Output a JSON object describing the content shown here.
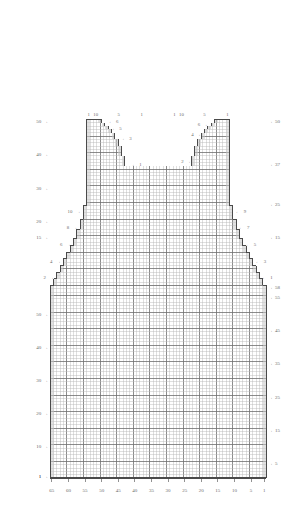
{
  "chart_data": {
    "type": "table",
    "title": "",
    "subtitle": "",
    "xlabel": "",
    "ylabel": "",
    "grid": true,
    "legend_position": "none",
    "cell_px": 3.32,
    "major_every": 5,
    "stitch_columns": 65,
    "bottom_rows": 58,
    "top_rows": 50,
    "x_axis": {
      "label": "",
      "ticks": [
        {
          "value": 65,
          "text": "65"
        },
        {
          "value": 60,
          "text": "60"
        },
        {
          "value": 55,
          "text": "55"
        },
        {
          "value": 50,
          "text": "50"
        },
        {
          "value": 45,
          "text": "45"
        },
        {
          "value": 40,
          "text": "40"
        },
        {
          "value": 35,
          "text": "35"
        },
        {
          "value": 30,
          "text": "30"
        },
        {
          "value": 25,
          "text": "25"
        },
        {
          "value": 20,
          "text": "20"
        },
        {
          "value": 15,
          "text": "15"
        },
        {
          "value": 10,
          "text": "10"
        },
        {
          "value": 5,
          "text": "5"
        },
        {
          "value": 1,
          "text": "1"
        }
      ]
    },
    "left_axis_upper": {
      "ticks": [
        {
          "value": 50,
          "text": "50"
        },
        {
          "value": 40,
          "text": "40"
        },
        {
          "value": 30,
          "text": "30"
        },
        {
          "value": 20,
          "text": "20"
        },
        {
          "value": 15,
          "text": "15"
        }
      ]
    },
    "right_axis_upper": {
      "ticks": [
        {
          "value": 50,
          "text": "50"
        },
        {
          "value": 37,
          "text": "37"
        },
        {
          "value": 25,
          "text": "25"
        },
        {
          "value": 15,
          "text": "15"
        }
      ]
    },
    "left_axis_lower": {
      "ticks": [
        {
          "value": 50,
          "text": "50"
        },
        {
          "value": 40,
          "text": "40"
        },
        {
          "value": 30,
          "text": "30"
        },
        {
          "value": 20,
          "text": "20"
        },
        {
          "value": 10,
          "text": "10"
        },
        {
          "value": 1,
          "text": "1"
        }
      ]
    },
    "right_axis_lower": {
      "ticks": [
        {
          "value": 58,
          "text": "58"
        },
        {
          "value": 55,
          "text": "55"
        },
        {
          "value": 45,
          "text": "45"
        },
        {
          "value": 35,
          "text": "35"
        },
        {
          "value": 25,
          "text": "25"
        },
        {
          "value": 15,
          "text": "15"
        },
        {
          "value": 5,
          "text": "5"
        }
      ]
    },
    "top_column_labels_left": [
      {
        "text": "1",
        "col": 1
      },
      {
        "text": "10",
        "col": 10
      },
      {
        "text": "5",
        "col": 5
      },
      {
        "text": "1",
        "col": 1
      }
    ],
    "top_column_labels_right": [
      {
        "text": "1",
        "col": 1
      },
      {
        "text": "10",
        "col": 10
      },
      {
        "text": "5",
        "col": 5
      },
      {
        "text": "1",
        "col": 1
      }
    ],
    "neckline_left_steps": [
      {
        "text": "6"
      },
      {
        "text": "5"
      },
      {
        "text": "3"
      },
      {
        "text": "1"
      }
    ],
    "neckline_right_steps": [
      {
        "text": "6"
      },
      {
        "text": "4"
      },
      {
        "text": "2"
      }
    ],
    "armhole_left_steps": [
      {
        "text": "10"
      },
      {
        "text": "8"
      },
      {
        "text": "6"
      },
      {
        "text": "4"
      },
      {
        "text": "2"
      }
    ],
    "armhole_right_steps": [
      {
        "text": "9"
      },
      {
        "text": "7"
      },
      {
        "text": "5"
      },
      {
        "text": "3"
      },
      {
        "text": "1"
      }
    ],
    "colors": {
      "grid_minor": "#b9b9b9",
      "grid_major": "#6e6e6e",
      "outline": "#4a4a4a",
      "selvedge_fill": "#c9c9c9",
      "text": "#6a6a6a",
      "background": "#ffffff"
    }
  }
}
